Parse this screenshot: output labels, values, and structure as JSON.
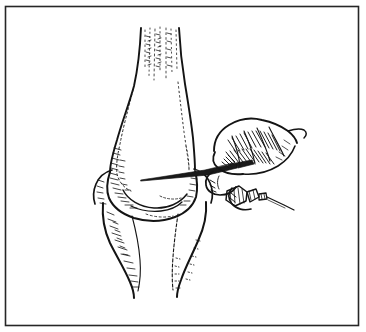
{
  "figure": {
    "domain": "Natural-Image",
    "kind": "line-art-medical-illustration",
    "alt_text": "Black and white pen-and-ink line drawing of a flexed knee joint seen from the front, with a surgeon's gloved hand at the right holding a scalpel whose blade rests on the lateral aspect of the distal femur, about to make a parapatellar incision.",
    "background_color": "#ffffff",
    "ink_color": "#1a1a1a",
    "frame": {
      "name": "illustration-border",
      "x": 5,
      "y": 6,
      "width": 354,
      "height": 320,
      "stroke_color": "#262626",
      "stroke_width": 1.6,
      "fill": "none"
    },
    "parts": [
      {
        "id": "femur-shaft",
        "label": "Distal femur / thigh shaft"
      },
      {
        "id": "femoral-condyles",
        "label": "Femoral condyles"
      },
      {
        "id": "patella",
        "label": "Patella"
      },
      {
        "id": "joint-line",
        "label": "Knee joint line"
      },
      {
        "id": "tibia",
        "label": "Proximal tibia / lower leg"
      },
      {
        "id": "surgeon-hand",
        "label": "Surgeon's hand"
      },
      {
        "id": "scalpel",
        "label": "Scalpel"
      },
      {
        "id": "second-instrument",
        "label": "Second instrument held in fingers"
      },
      {
        "id": "muscle-striations",
        "label": "Quadriceps striation hatching"
      },
      {
        "id": "shading-hatching",
        "label": "Cross-hatched shading"
      }
    ],
    "text_labels": []
  }
}
